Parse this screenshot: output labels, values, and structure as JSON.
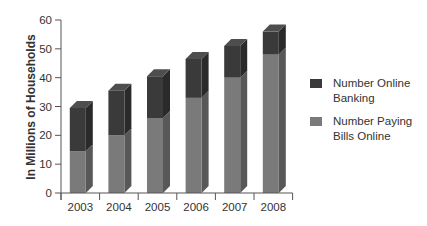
{
  "chart_data": {
    "type": "bar",
    "stacked": true,
    "style": "3d",
    "title": "",
    "xlabel": "",
    "ylabel": "In Millions of Households",
    "categories": [
      "2003",
      "2004",
      "2005",
      "2006",
      "2007",
      "2008"
    ],
    "series": [
      {
        "name": "Number Paying Bills Online",
        "values": [
          14.5,
          20,
          26,
          33,
          40,
          48
        ],
        "color": "#7a7a7a"
      },
      {
        "name": "Number Online Banking",
        "values": [
          15,
          15.5,
          14.5,
          13.5,
          11,
          8
        ],
        "color": "#3a3a3a"
      }
    ],
    "totals": [
      29.5,
      35.5,
      40.5,
      46.5,
      51,
      56
    ],
    "ylim": [
      0,
      60
    ],
    "yticks": [
      0,
      10,
      20,
      30,
      40,
      50,
      60
    ],
    "grid": false,
    "legend_position": "right"
  },
  "legend": {
    "items": [
      {
        "label": "Number Online Banking",
        "line1": "Number Online",
        "line2": "Banking",
        "color": "#3a3a3a"
      },
      {
        "label": "Number Paying Bills Online",
        "line1": "Number Paying",
        "line2": "Bills Online",
        "color": "#7a7a7a"
      }
    ]
  }
}
